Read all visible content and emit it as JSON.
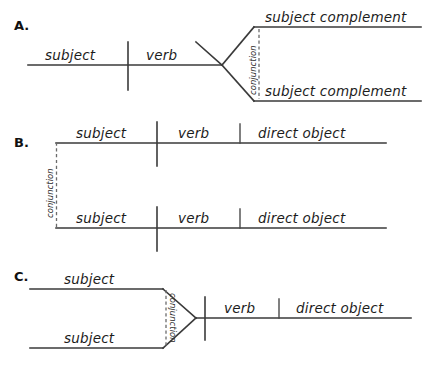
{
  "page": {
    "background_color": "#ffffff",
    "line_color": "#3a3a3a",
    "dashed_line_color": "#6b6b6b",
    "text_color": "#1c1c1c"
  },
  "sections": [
    {
      "letter": "A.",
      "description": "Simple sentence with compound subject complement joined by a conjunction",
      "labels": {
        "subject": "subject",
        "verb": "verb",
        "complement_top": "subject complement",
        "complement_bottom": "subject complement",
        "conjunction": "conjunction"
      }
    },
    {
      "letter": "B.",
      "description": "Compound sentence: two independent clauses joined by a conjunction",
      "labels": {
        "clause_top": {
          "subject": "subject",
          "verb": "verb",
          "direct_object": "direct  object"
        },
        "clause_bottom": {
          "subject": "subject",
          "verb": "verb",
          "direct_object": "direct  object"
        },
        "conjunction": "conjunction"
      }
    },
    {
      "letter": "C.",
      "description": "Simple sentence with compound subject joined by a conjunction",
      "labels": {
        "subject_top": "subject",
        "subject_bottom": "subject",
        "verb": "verb",
        "direct_object": "direct object",
        "conjunction": "conjunction"
      }
    }
  ]
}
